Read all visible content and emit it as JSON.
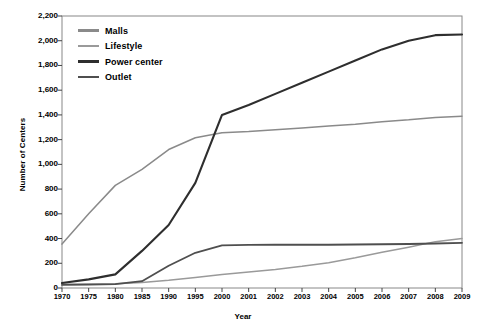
{
  "chart_data": {
    "type": "line",
    "title": "",
    "xlabel": "Year",
    "ylabel": "Number of Centers",
    "ylim": [
      0,
      2200
    ],
    "ytick_step": 200,
    "grid": false,
    "legend_position": "top-left",
    "categories": [
      "1970",
      "1975",
      "1980",
      "1985",
      "1990",
      "1995",
      "2000",
      "2001",
      "2002",
      "2003",
      "2004",
      "2005",
      "2006",
      "2007",
      "2008",
      "2009"
    ],
    "yticks": [
      "0",
      "200",
      "400",
      "600",
      "800",
      "1,000",
      "1,200",
      "1,400",
      "1,600",
      "1,800",
      "2,000",
      "2,200"
    ],
    "series": [
      {
        "name": "Malls",
        "color": "#8a8a8a",
        "values": [
          355,
          600,
          830,
          960,
          1120,
          1215,
          1255,
          1265,
          1280,
          1295,
          1310,
          1325,
          1345,
          1360,
          1380,
          1390
        ]
      },
      {
        "name": "Lifestyle",
        "color": "#9a9a9a",
        "values": [
          30,
          32,
          35,
          45,
          62,
          85,
          110,
          130,
          150,
          175,
          205,
          245,
          290,
          330,
          375,
          400
        ]
      },
      {
        "name": "Power center",
        "color": "#2e2e2e",
        "values": [
          40,
          70,
          110,
          300,
          510,
          850,
          1400,
          1480,
          1570,
          1660,
          1750,
          1840,
          1930,
          2000,
          2045,
          2050
        ]
      },
      {
        "name": "Outlet",
        "color": "#4f4f4f",
        "values": [
          25,
          28,
          32,
          55,
          180,
          285,
          345,
          348,
          350,
          350,
          350,
          352,
          354,
          356,
          360,
          365
        ]
      }
    ]
  },
  "axis": {
    "y_title": "Number of Centers",
    "x_title": "Year"
  }
}
